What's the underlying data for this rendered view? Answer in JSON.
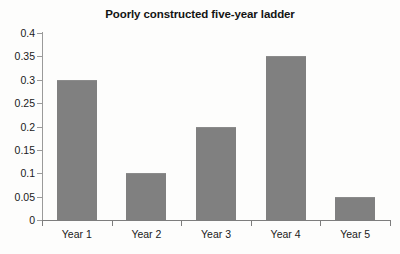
{
  "chart_data": {
    "type": "bar",
    "title": "Poorly constructed five-year ladder",
    "subtitle": "",
    "xlabel": "",
    "ylabel": "",
    "categories": [
      "Year 1",
      "Year 2",
      "Year 3",
      "Year 4",
      "Year 5"
    ],
    "values": [
      0.3,
      0.1,
      0.2,
      0.35,
      0.05
    ],
    "ylim": [
      0,
      0.4
    ],
    "ytick_labels": [
      "0",
      "0.05",
      "0.1",
      "0.15",
      "0.2",
      "0.25",
      "0.3",
      "0.35",
      "0.4"
    ],
    "ytick_values": [
      0,
      0.05,
      0.1,
      0.15,
      0.2,
      0.25,
      0.3,
      0.35,
      0.4
    ],
    "grid": false,
    "legend": false,
    "legend_position": "none",
    "bar_color": "#808080",
    "axis_color": "#8a8a8a",
    "background_color": "#fdfdfc",
    "text_color": "#1a1a1a"
  }
}
